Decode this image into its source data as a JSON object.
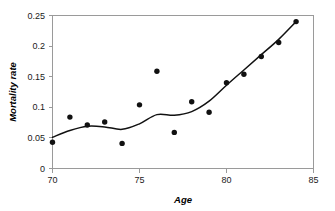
{
  "chart_data": {
    "type": "scatter",
    "title": "",
    "xlabel": "Age",
    "ylabel": "Mortality rate",
    "xlim": [
      70,
      85
    ],
    "ylim": [
      0,
      0.25
    ],
    "xticks": [
      "70",
      "75",
      "80",
      "85"
    ],
    "xtick_values": [
      70,
      75,
      80,
      85
    ],
    "yticks": [
      "0",
      "0.05",
      "0.1",
      "0.15",
      "0.2",
      "0.25"
    ],
    "ytick_values": [
      0,
      0.05,
      0.1,
      0.15,
      0.2,
      0.25
    ],
    "grid": false,
    "legend": false,
    "series": [
      {
        "name": "Observed mortality rate",
        "type": "scatter",
        "marker": "circle",
        "color": "#111111",
        "x": [
          70,
          71,
          72,
          73,
          74,
          75,
          76,
          77,
          78,
          79,
          80,
          81,
          82,
          83,
          84
        ],
        "values": [
          0.043,
          0.084,
          0.071,
          0.076,
          0.041,
          0.104,
          0.159,
          0.059,
          0.109,
          0.092,
          0.14,
          0.154,
          0.183,
          0.206,
          0.24
        ]
      },
      {
        "name": "Fitted smooth curve",
        "type": "line",
        "color": "#111111",
        "x": [
          70,
          71,
          72,
          73,
          74,
          75,
          76,
          77,
          78,
          79,
          80,
          81,
          82,
          83,
          84
        ],
        "values": [
          0.051,
          0.062,
          0.069,
          0.068,
          0.064,
          0.073,
          0.088,
          0.087,
          0.093,
          0.11,
          0.136,
          0.161,
          0.186,
          0.211,
          0.24
        ]
      }
    ]
  }
}
